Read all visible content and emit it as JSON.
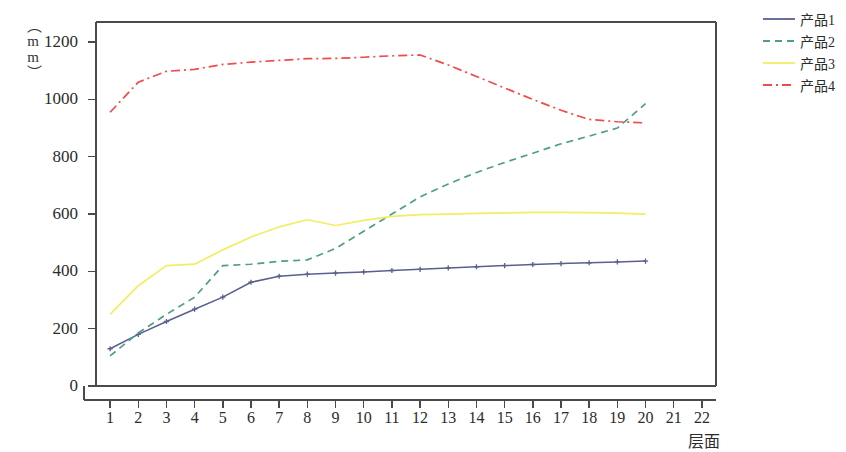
{
  "chart_data": {
    "type": "line",
    "title": "",
    "xlabel": "层面",
    "ylabel": "（mm）",
    "xlim": [
      0.5,
      22.5
    ],
    "ylim": [
      0,
      1270
    ],
    "yticks": [
      0,
      200,
      400,
      600,
      800,
      1000,
      1200
    ],
    "xticks": [
      1,
      2,
      3,
      4,
      5,
      6,
      7,
      8,
      9,
      10,
      11,
      12,
      13,
      14,
      15,
      16,
      17,
      18,
      19,
      20,
      21,
      22
    ],
    "grid": false,
    "legend_position": "right",
    "x": [
      1,
      2,
      3,
      4,
      5,
      6,
      7,
      8,
      9,
      10,
      11,
      12,
      13,
      14,
      15,
      16,
      17,
      18,
      19,
      20
    ],
    "series": [
      {
        "name": "产品1",
        "color": "#5a5f8f",
        "style": "solid",
        "marker": "plus",
        "values": [
          130,
          180,
          225,
          268,
          310,
          362,
          383,
          390,
          394,
          398,
          403,
          407,
          412,
          416,
          420,
          424,
          427,
          430,
          433,
          436
        ]
      },
      {
        "name": "产品2",
        "color": "#4f9e8c",
        "style": "dashed",
        "marker": "none",
        "values": [
          105,
          185,
          250,
          310,
          420,
          425,
          435,
          440,
          480,
          540,
          600,
          660,
          705,
          745,
          780,
          812,
          845,
          872,
          900,
          985
        ]
      },
      {
        "name": "产品3",
        "color": "#f2ee63",
        "style": "solid",
        "marker": "none",
        "values": [
          250,
          350,
          420,
          425,
          475,
          520,
          555,
          580,
          560,
          578,
          592,
          598,
          600,
          602,
          604,
          606,
          606,
          605,
          603,
          600
        ]
      },
      {
        "name": "产品4",
        "color": "#f04a4a",
        "style": "dashdot",
        "marker": "none",
        "values": [
          955,
          1060,
          1098,
          1105,
          1122,
          1130,
          1136,
          1142,
          1143,
          1147,
          1152,
          1155,
          1120,
          1080,
          1040,
          1000,
          962,
          930,
          922,
          918
        ]
      }
    ]
  },
  "legend": {
    "items": [
      {
        "label": "产品1"
      },
      {
        "label": "产品2"
      },
      {
        "label": "产品3"
      },
      {
        "label": "产品4"
      }
    ]
  },
  "axes": {
    "y_unit": "（mm）",
    "x_title": "层面",
    "y_tick_labels": [
      "1200",
      "1000",
      "800",
      "600",
      "400",
      "200",
      "0"
    ],
    "x_tick_labels": [
      "1",
      "2",
      "3",
      "4",
      "5",
      "6",
      "7",
      "8",
      "9",
      "10",
      "11",
      "12",
      "13",
      "14",
      "15",
      "16",
      "17",
      "18",
      "19",
      "20",
      "21",
      "22"
    ]
  },
  "colors": {
    "series1": "#5a5f8f",
    "series2": "#4f9e8c",
    "series3": "#f2ee63",
    "series4": "#f04a4a",
    "axis": "#4a4a4a"
  }
}
